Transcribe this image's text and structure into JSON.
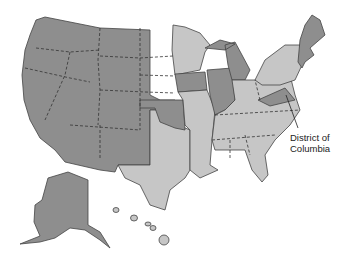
{
  "map": {
    "title": "United States",
    "legend_colors": {
      "dark": "#8e8e8e",
      "light": "#c6c6c6"
    },
    "annotation": {
      "line1": "District of",
      "line2": "Columbia"
    },
    "dark_states": [
      "WA",
      "OR",
      "CA",
      "NV",
      "ID",
      "MT",
      "WY",
      "UT",
      "AZ",
      "CO",
      "NM",
      "ND",
      "SD",
      "NE",
      "KS",
      "OK",
      "IA",
      "IL",
      "IN",
      "MI",
      "VA",
      "NJ",
      "CT",
      "VT",
      "NH",
      "ME",
      "MA",
      "AK"
    ],
    "light_states": [
      "TX",
      "MN",
      "WI",
      "MO",
      "AR",
      "LA",
      "MS",
      "AL",
      "GA",
      "FL",
      "SC",
      "NC",
      "TN",
      "KY",
      "OH",
      "WV",
      "PA",
      "NY",
      "HI"
    ]
  }
}
